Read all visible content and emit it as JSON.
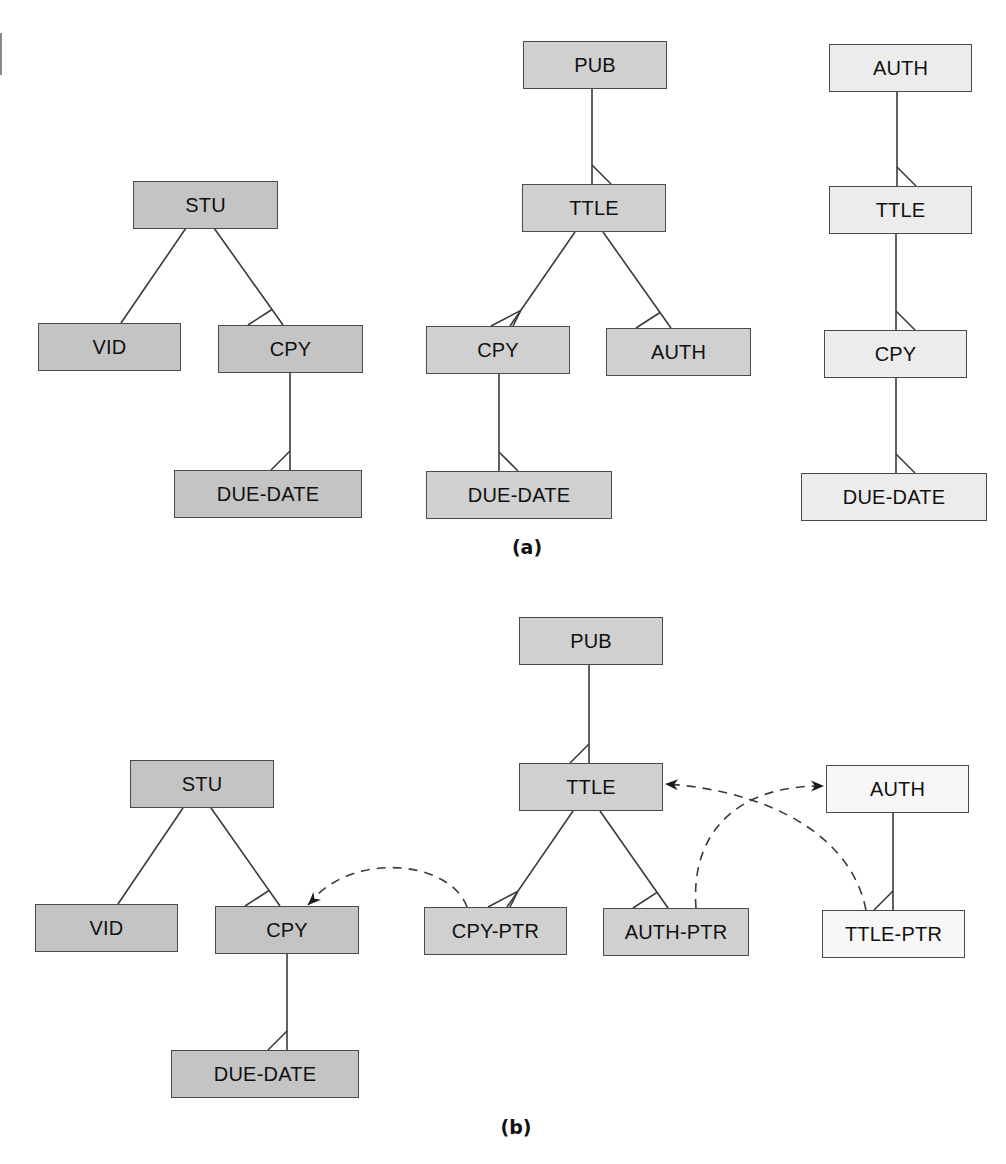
{
  "colors": {
    "dark": "#c4c4c4",
    "mid": "#d0d0d0",
    "light": "#ececec",
    "white": "#f7f7f7",
    "line": "#3a3a3a"
  },
  "panels": [
    {
      "caption": "(a)",
      "caption_pos": [
        527,
        548
      ],
      "nodes": [
        {
          "id": "a-stu",
          "label": "STU",
          "x": 133,
          "y": 181,
          "w": 145,
          "h": 48,
          "fill": "dark"
        },
        {
          "id": "a-vid",
          "label": "VID",
          "x": 38,
          "y": 323,
          "w": 143,
          "h": 48,
          "fill": "dark"
        },
        {
          "id": "a-cpy",
          "label": "CPY",
          "x": 218,
          "y": 325,
          "w": 145,
          "h": 48,
          "fill": "dark"
        },
        {
          "id": "a-due",
          "label": "DUE-DATE",
          "x": 174,
          "y": 470,
          "w": 188,
          "h": 48,
          "fill": "dark"
        },
        {
          "id": "a-pub",
          "label": "PUB",
          "x": 523,
          "y": 41,
          "w": 144,
          "h": 48,
          "fill": "mid"
        },
        {
          "id": "a-ttle",
          "label": "TTLE",
          "x": 522,
          "y": 184,
          "w": 144,
          "h": 48,
          "fill": "mid"
        },
        {
          "id": "a-cpy2",
          "label": "CPY",
          "x": 426,
          "y": 326,
          "w": 144,
          "h": 48,
          "fill": "mid"
        },
        {
          "id": "a-auth",
          "label": "AUTH",
          "x": 606,
          "y": 328,
          "w": 145,
          "h": 48,
          "fill": "mid"
        },
        {
          "id": "a-due2",
          "label": "DUE-DATE",
          "x": 426,
          "y": 471,
          "w": 186,
          "h": 48,
          "fill": "mid"
        },
        {
          "id": "a-auth3",
          "label": "AUTH",
          "x": 829,
          "y": 44,
          "w": 143,
          "h": 48,
          "fill": "light"
        },
        {
          "id": "a-ttle3",
          "label": "TTLE",
          "x": 829,
          "y": 186,
          "w": 143,
          "h": 48,
          "fill": "light"
        },
        {
          "id": "a-cpy3",
          "label": "CPY",
          "x": 824,
          "y": 330,
          "w": 143,
          "h": 48,
          "fill": "light"
        },
        {
          "id": "a-due3",
          "label": "DUE-DATE",
          "x": 801,
          "y": 473,
          "w": 186,
          "h": 48,
          "fill": "light"
        }
      ],
      "edges": [
        {
          "from": "a-stu",
          "to": "a-vid",
          "p1": [
            186,
            228
          ],
          "p2": [
            121,
            323
          ],
          "many": false
        },
        {
          "from": "a-stu",
          "to": "a-cpy",
          "p1": [
            214,
            228
          ],
          "p2": [
            283,
            325
          ],
          "many": true,
          "foot": "left"
        },
        {
          "from": "a-cpy",
          "to": "a-due",
          "p1": [
            290,
            373
          ],
          "p2": [
            290,
            470
          ],
          "many": true,
          "foot": "left"
        },
        {
          "from": "a-pub",
          "to": "a-ttle",
          "p1": [
            592,
            89
          ],
          "p2": [
            592,
            184
          ],
          "many": true,
          "foot": "right"
        },
        {
          "from": "a-ttle",
          "to": "a-cpy2",
          "p1": [
            575,
            232
          ],
          "p2": [
            510,
            326
          ],
          "many": true,
          "foot": "both"
        },
        {
          "from": "a-ttle",
          "to": "a-auth",
          "p1": [
            603,
            232
          ],
          "p2": [
            671,
            328
          ],
          "many": true,
          "foot": "left"
        },
        {
          "from": "a-cpy2",
          "to": "a-due2",
          "p1": [
            499,
            374
          ],
          "p2": [
            499,
            471
          ],
          "many": true,
          "foot": "right"
        },
        {
          "from": "a-auth3",
          "to": "a-ttle3",
          "p1": [
            897,
            92
          ],
          "p2": [
            897,
            186
          ],
          "many": true,
          "foot": "right"
        },
        {
          "from": "a-ttle3",
          "to": "a-cpy3",
          "p1": [
            896,
            234
          ],
          "p2": [
            896,
            330
          ],
          "many": true,
          "foot": "right"
        },
        {
          "from": "a-cpy3",
          "to": "a-due3",
          "p1": [
            896,
            378
          ],
          "p2": [
            896,
            473
          ],
          "many": true,
          "foot": "right"
        }
      ]
    },
    {
      "caption": "(b)",
      "caption_pos": [
        516,
        1128
      ],
      "nodes": [
        {
          "id": "b-stu",
          "label": "STU",
          "x": 130,
          "y": 760,
          "w": 144,
          "h": 48,
          "fill": "dark"
        },
        {
          "id": "b-vid",
          "label": "VID",
          "x": 35,
          "y": 904,
          "w": 143,
          "h": 48,
          "fill": "dark"
        },
        {
          "id": "b-cpy",
          "label": "CPY",
          "x": 215,
          "y": 906,
          "w": 144,
          "h": 48,
          "fill": "dark"
        },
        {
          "id": "b-due",
          "label": "DUE-DATE",
          "x": 171,
          "y": 1050,
          "w": 188,
          "h": 48,
          "fill": "dark"
        },
        {
          "id": "b-pub",
          "label": "PUB",
          "x": 519,
          "y": 617,
          "w": 144,
          "h": 48,
          "fill": "mid"
        },
        {
          "id": "b-ttle",
          "label": "TTLE",
          "x": 519,
          "y": 763,
          "w": 144,
          "h": 48,
          "fill": "mid"
        },
        {
          "id": "b-cpyp",
          "label": "CPY-PTR",
          "x": 424,
          "y": 907,
          "w": 143,
          "h": 48,
          "fill": "mid"
        },
        {
          "id": "b-authp",
          "label": "AUTH-PTR",
          "x": 603,
          "y": 908,
          "w": 146,
          "h": 48,
          "fill": "mid"
        },
        {
          "id": "b-auth",
          "label": "AUTH",
          "x": 826,
          "y": 765,
          "w": 143,
          "h": 48,
          "fill": "white"
        },
        {
          "id": "b-ttlep",
          "label": "TTLE-PTR",
          "x": 822,
          "y": 910,
          "w": 143,
          "h": 48,
          "fill": "white"
        }
      ],
      "edges": [
        {
          "from": "b-stu",
          "to": "b-vid",
          "p1": [
            183,
            808
          ],
          "p2": [
            118,
            904
          ],
          "many": false
        },
        {
          "from": "b-stu",
          "to": "b-cpy",
          "p1": [
            211,
            808
          ],
          "p2": [
            280,
            906
          ],
          "many": true,
          "foot": "left"
        },
        {
          "from": "b-cpy",
          "to": "b-due",
          "p1": [
            287,
            954
          ],
          "p2": [
            287,
            1050
          ],
          "many": true,
          "foot": "left"
        },
        {
          "from": "b-pub",
          "to": "b-ttle",
          "p1": [
            589,
            665
          ],
          "p2": [
            589,
            763
          ],
          "many": true,
          "foot": "left"
        },
        {
          "from": "b-ttle",
          "to": "b-cpyp",
          "p1": [
            573,
            811
          ],
          "p2": [
            507,
            907
          ],
          "many": true,
          "foot": "both"
        },
        {
          "from": "b-ttle",
          "to": "b-authp",
          "p1": [
            600,
            811
          ],
          "p2": [
            668,
            908
          ],
          "many": true,
          "foot": "left"
        },
        {
          "from": "b-auth",
          "to": "b-ttlep",
          "p1": [
            893,
            813
          ],
          "p2": [
            893,
            910
          ],
          "many": true,
          "foot": "left"
        }
      ],
      "pointers": [
        {
          "from": "b-cpyp",
          "to": "b-cpy",
          "path": "M 467 907 C 450 860, 350 850, 308 905",
          "arrow_at": [
            308,
            905
          ],
          "arrow_dir": [
            -0.7,
            0.7
          ]
        },
        {
          "from": "b-authp",
          "to": "b-auth",
          "path": "M 696 908 C 690 830, 740 785, 823 786",
          "arrow_at": [
            824,
            786
          ],
          "arrow_dir": [
            1,
            0
          ]
        },
        {
          "from": "b-ttlep",
          "to": "b-ttle",
          "path": "M 866 910 C 850 830, 760 790, 666 784",
          "arrow_at": [
            665,
            784
          ],
          "arrow_dir": [
            -1,
            -0.05
          ]
        }
      ]
    }
  ]
}
